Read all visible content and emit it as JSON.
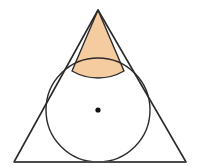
{
  "canvas": {
    "width": 198,
    "height": 167,
    "background_color": "#FFFFFF"
  },
  "figure": {
    "name": "triangle-with-inscribed-circle",
    "triangle": {
      "name": "outer-triangle",
      "points": "98,10 186,162 14,162",
      "apex": {
        "x": 98,
        "y": 10
      },
      "bottom_left": {
        "x": 14,
        "y": 162
      },
      "bottom_right": {
        "x": 186,
        "y": 162
      },
      "stroke_color": "#2B2B2B",
      "stroke_width": 1.6,
      "fill_color": "none"
    },
    "circle": {
      "name": "inscribed-circle",
      "center": {
        "x": 98,
        "y": 110
      },
      "radius": 52,
      "stroke_color": "#2B2B2B",
      "stroke_width": 1.4,
      "fill_color": "none"
    },
    "center_dot": {
      "name": "circle-center-dot",
      "center": {
        "x": 98,
        "y": 110
      },
      "radius": 2.6,
      "fill_color": "#111111"
    },
    "shaded_region": {
      "name": "apex-cap-region",
      "fill_color": "#F5CBA0",
      "stroke_color": "#2B2B2B",
      "stroke_width": 1.4,
      "tangent_left": {
        "x": 72.0,
        "y": 71.0
      },
      "tangent_right": {
        "x": 124.0,
        "y": 71.0
      },
      "path": "M 98 10 L 124.0 71.0 A 52 52 0 0 1 72.0 71.0 Z"
    },
    "baseline": {
      "name": "triangle-base-line",
      "x1": 14,
      "y1": 162,
      "x2": 186,
      "y2": 162,
      "stroke_color": "#4A4A4A",
      "stroke_width": 1.8
    }
  }
}
